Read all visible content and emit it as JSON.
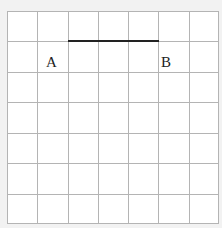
{
  "diagram": {
    "grid": {
      "columns": 7,
      "rows": 7,
      "cell_px": 30.3,
      "line_color": "#b4b4b4"
    },
    "segment": {
      "from": [
        2,
        1
      ],
      "to": [
        5,
        1
      ],
      "color": "#222222"
    },
    "points": [
      {
        "label": "A",
        "x": 45,
        "y": 45
      },
      {
        "label": "B",
        "x": 160,
        "y": 45
      }
    ]
  }
}
